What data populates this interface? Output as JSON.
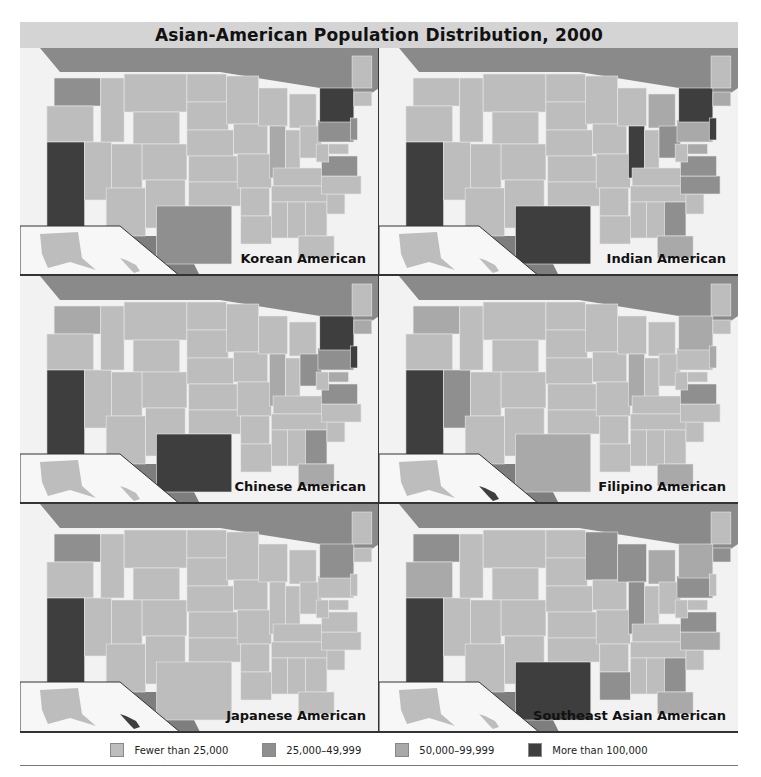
{
  "title": "Asian-American Population Distribution, 2000",
  "colors": {
    "water": "#f2f2f2",
    "canada": "#8a8a8a",
    "mexico": "#7e7e7e",
    "border": "#e8e8e8",
    "cat1": "#bdbdbd",
    "cat2": "#8f8f8f",
    "cat3": "#a9a9a9",
    "cat4": "#3e3e3e"
  },
  "legend": [
    {
      "label": "Fewer than 25,000",
      "color": "#bdbdbd"
    },
    {
      "label": "25,000–49,999",
      "color": "#8f8f8f"
    },
    {
      "label": "50,000–99,999",
      "color": "#a9a9a9"
    },
    {
      "label": "More than 100,000",
      "color": "#3e3e3e"
    }
  ],
  "panels": [
    {
      "label": "Korean American",
      "over100k": [
        "CA",
        "NY"
      ],
      "between25k_50k": [
        "WA",
        "TX",
        "PA",
        "VA",
        "NJ"
      ],
      "between50k_100k": [
        "IL"
      ]
    },
    {
      "label": "Indian American",
      "over100k": [
        "CA",
        "NY",
        "TX",
        "IL",
        "NJ"
      ],
      "between25k_50k": [
        "OH",
        "GA",
        "VA",
        "NC"
      ],
      "between50k_100k": [
        "PA",
        "MI",
        "MA",
        "FL",
        "MD"
      ]
    },
    {
      "label": "Chinese American",
      "over100k": [
        "CA",
        "NY",
        "TX",
        "NJ"
      ],
      "between25k_50k": [
        "OH",
        "GA",
        "VA",
        "PA"
      ],
      "between50k_100k": [
        "WA",
        "IL",
        "MA",
        "MD",
        "FL"
      ]
    },
    {
      "label": "Filipino American",
      "over100k": [
        "CA",
        "HI"
      ],
      "between25k_50k": [
        "NV",
        "VA"
      ],
      "between50k_100k": [
        "WA",
        "TX",
        "IL",
        "NJ",
        "NY",
        "FL"
      ]
    },
    {
      "label": "Japanese American",
      "over100k": [
        "CA",
        "HI"
      ],
      "between25k_50k": [
        "WA",
        "NY"
      ],
      "between50k_100k": []
    },
    {
      "label": "Southeast Asian American",
      "over100k": [
        "CA",
        "TX"
      ],
      "between25k_50k": [
        "WA",
        "MN",
        "WI",
        "IL",
        "PA",
        "VA",
        "GA",
        "LA",
        "MA"
      ],
      "between50k_100k": [
        "NY",
        "FL",
        "NC",
        "MI",
        "OR"
      ]
    }
  ],
  "chart_data": {
    "type": "choropleth",
    "title": "Asian-American Population Distribution, 2000",
    "categories": [
      "Fewer than 25,000",
      "25,000–49,999",
      "50,000–99,999",
      "More than 100,000"
    ],
    "maps": [
      {
        "name": "Korean American",
        "More than 100,000": [
          "CA",
          "NY"
        ]
      },
      {
        "name": "Indian American",
        "More than 100,000": [
          "CA",
          "NY",
          "TX",
          "IL",
          "NJ"
        ]
      },
      {
        "name": "Chinese American",
        "More than 100,000": [
          "CA",
          "NY",
          "TX",
          "NJ"
        ]
      },
      {
        "name": "Filipino American",
        "More than 100,000": [
          "CA",
          "HI"
        ]
      },
      {
        "name": "Japanese American",
        "More than 100,000": [
          "CA",
          "HI"
        ]
      },
      {
        "name": "Southeast Asian American",
        "More than 100,000": [
          "CA",
          "TX"
        ]
      }
    ]
  }
}
